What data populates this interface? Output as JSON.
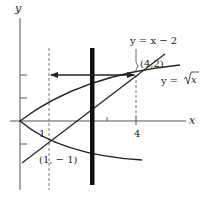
{
  "figure": {
    "axes": {
      "x_label": "x",
      "y_label": "y",
      "x_ticks": [
        {
          "value": 1,
          "label": "1"
        },
        {
          "value": 4,
          "label": "4"
        }
      ],
      "y_ticks": [
        {
          "value": 2,
          "label": ""
        },
        {
          "value": 1,
          "label": ""
        },
        {
          "value": -1,
          "label": ""
        }
      ]
    },
    "curves": [
      {
        "name": "parabola",
        "label": "y = √x",
        "label_prefix": "y = ",
        "label_radicand": "x"
      },
      {
        "name": "line",
        "label": "y = x − 2"
      }
    ],
    "points": [
      {
        "label": "(4,2)",
        "x": 4,
        "y": 2
      },
      {
        "label": "(1, − 1)",
        "x": 1,
        "y": -1
      }
    ],
    "annotations": {
      "line_label": "y = x − 2",
      "sqrt_label_prefix": "y = ",
      "sqrt_label_radicand": "x",
      "point_upper": "(4,2)",
      "point_lower": "(1, − 1)",
      "tick_1": "1",
      "tick_4": "4"
    },
    "elements": {
      "thick_bar": "vertical representative rectangle (vertical strip)",
      "arrow": "horizontal arrow from x=4 to x=1 at y=2"
    },
    "colors": {
      "ink": "#222222",
      "axis": "#555555",
      "dashed": "#666666",
      "background": "#ffffff"
    }
  }
}
